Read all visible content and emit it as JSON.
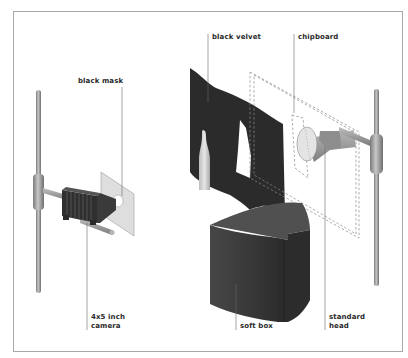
{
  "diagram": {
    "type": "lighting-setup",
    "labels": {
      "black_mask": "black mask",
      "black_velvet": "black velvet",
      "chipboard": "chipboard",
      "camera_line1": "4x5 inch",
      "camera_line2": "camera",
      "soft_box": "soft box",
      "head_line1": "standard",
      "head_line2": "head"
    },
    "colors": {
      "frame": "#a8a8a8",
      "velvet": "#2b2b2b",
      "soft_box": "#3d3d3d",
      "rod": "#9a9a9a",
      "mask": "#d8d8d8",
      "leader_line": "#6a6a6a"
    }
  }
}
